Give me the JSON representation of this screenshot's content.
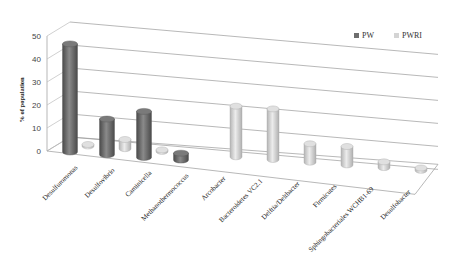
{
  "chart_data": {
    "type": "bar",
    "style": "3d-cylinder",
    "title": "",
    "xlabel": "",
    "ylabel": "% of population",
    "ylim": [
      0,
      50
    ],
    "yticks": [
      0,
      10,
      20,
      30,
      40,
      50
    ],
    "grid": true,
    "legend_position": "top-right",
    "categories": [
      "Desulfuromonas",
      "Desulfovibrio",
      "Caminicella",
      "Methanothermococcus",
      "Arcobacter",
      "Bacteroidetes VC2.1",
      "Delftia/Deltbacter",
      "Firmicutes",
      "Sphingobacteriales WCHB1-69",
      "Desulfobacter"
    ],
    "series": [
      {
        "name": "PW",
        "color": "#6e6e6e",
        "values": [
          47,
          15.5,
          20,
          3,
          0,
          0,
          0,
          0,
          0,
          0
        ]
      },
      {
        "name": "PWRI",
        "color": "#d4d4d4",
        "values": [
          0.5,
          4,
          0.5,
          0,
          22,
          22,
          8,
          8,
          2.5,
          1
        ]
      }
    ]
  },
  "legend": {
    "items": [
      {
        "label": "PW",
        "color": "#6e6e6e"
      },
      {
        "label": "PWRI",
        "color": "#d4d4d4"
      }
    ]
  }
}
